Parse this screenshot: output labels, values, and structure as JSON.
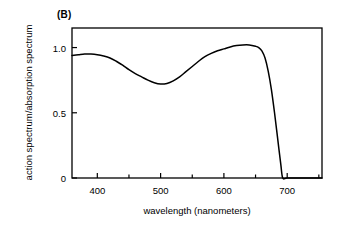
{
  "figure": {
    "panel_label": "(B)",
    "background_color": "#ffffff",
    "line_color": "#000000",
    "axis_color": "#000000"
  },
  "chart_data": {
    "type": "line",
    "title": "",
    "subtitle": "",
    "panel": "(B)",
    "xlabel": "wavelength (nanometers)",
    "ylabel": "action spectrum/absorption spectrum",
    "xlim": [
      360,
      755
    ],
    "ylim": [
      0,
      1.15
    ],
    "grid": false,
    "legend": null,
    "x_major_ticks": [
      400,
      500,
      600,
      700
    ],
    "x_major_tick_labels": [
      "400",
      "500",
      "600",
      "700"
    ],
    "x_minor_ticks": [
      450,
      550,
      650,
      750
    ],
    "y_ticks": [
      0,
      0.5,
      1.0
    ],
    "y_tick_labels": [
      "0",
      "0.5",
      "1.0"
    ],
    "series": [
      {
        "name": "action spectrum/absorption spectrum ratio",
        "x": [
          360,
          370,
          380,
          390,
          400,
          410,
          420,
          430,
          440,
          450,
          460,
          470,
          480,
          490,
          500,
          510,
          520,
          530,
          540,
          550,
          560,
          570,
          580,
          590,
          600,
          610,
          620,
          630,
          640,
          650,
          655,
          660,
          665,
          670,
          675,
          680,
          685,
          690,
          693,
          700,
          720,
          740,
          755
        ],
        "y": [
          0.94,
          0.945,
          0.95,
          0.95,
          0.945,
          0.935,
          0.92,
          0.895,
          0.865,
          0.83,
          0.8,
          0.775,
          0.75,
          0.73,
          0.72,
          0.725,
          0.745,
          0.775,
          0.815,
          0.855,
          0.895,
          0.93,
          0.955,
          0.975,
          0.99,
          1.005,
          1.015,
          1.02,
          1.02,
          1.01,
          1.0,
          0.975,
          0.92,
          0.82,
          0.68,
          0.5,
          0.3,
          0.1,
          0.0,
          0.0,
          0.0,
          0.0,
          0.0
        ]
      }
    ],
    "annotations": [
      {
        "label": "local maximum",
        "x": 385,
        "y": 0.95
      },
      {
        "label": "minimum",
        "x": 500,
        "y": 0.72
      },
      {
        "label": "plateau maximum",
        "x": 630,
        "y": 1.02
      },
      {
        "label": "cutoff to zero",
        "x": 693,
        "y": 0.0
      }
    ]
  },
  "axes_geometry": {
    "frame_left_px": 72,
    "frame_right_px": 322,
    "frame_top_px": 28,
    "frame_bottom_px": 178
  }
}
